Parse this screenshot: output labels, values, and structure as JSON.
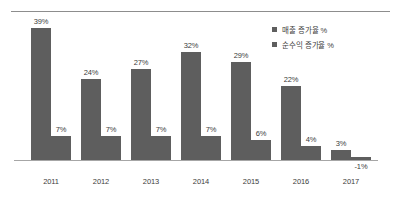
{
  "chart_data": {
    "type": "bar",
    "title": "",
    "subtitle": "",
    "xlabel": "",
    "ylabel": "",
    "grid": false,
    "legend_position": "top-right",
    "categories": [
      "2011",
      "2012",
      "2013",
      "2014",
      "2015",
      "2016",
      "2017"
    ],
    "series": [
      {
        "name": "매출 증가율 %",
        "color": "#5e5e5e",
        "values": [
          39,
          24,
          27,
          32,
          29,
          22,
          3
        ],
        "labels": [
          "39%",
          "24%",
          "27%",
          "32%",
          "29%",
          "22%",
          "3%"
        ]
      },
      {
        "name": "순수익 증가율 %",
        "color": "#5e5e5e",
        "values": [
          7,
          7,
          7,
          7,
          6,
          4,
          -1
        ],
        "labels": [
          "7%",
          "7%",
          "7%",
          "7%",
          "6%",
          "4%",
          "-1%"
        ]
      }
    ],
    "ylim": [
      -2,
      40
    ],
    "value_suffix": "%"
  },
  "legend": {
    "items": [
      {
        "label": "매출 증가율 %"
      },
      {
        "label": "순수익 증가율 %"
      }
    ]
  },
  "axis": {
    "category_labels": [
      "2011",
      "2012",
      "2013",
      "2014",
      "2015",
      "2016",
      "2017"
    ]
  },
  "style": {
    "bar_color": "#5e5e5e",
    "axis_color": "#a6a6a6",
    "rule_color": "#8d8d8d",
    "text_color": "#3c3c3c",
    "background": "#ffffff"
  }
}
